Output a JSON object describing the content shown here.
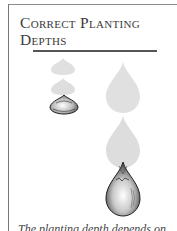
{
  "sidebar": {
    "title_lines": [
      "Correct Planting",
      "Depths"
    ],
    "caption_partial": "The planting depth depends on"
  },
  "illustrations": [
    {
      "name": "small-bulb-ghost-top"
    },
    {
      "name": "small-bulb-ghost-middle"
    },
    {
      "name": "small-bulb-planted"
    },
    {
      "name": "large-bulb-ghost-top"
    },
    {
      "name": "large-bulb-ghost-middle"
    },
    {
      "name": "large-bulb-planted"
    }
  ],
  "colors": {
    "ghost": "#dcdcdc",
    "ink": "#333333",
    "border": "#777777"
  }
}
